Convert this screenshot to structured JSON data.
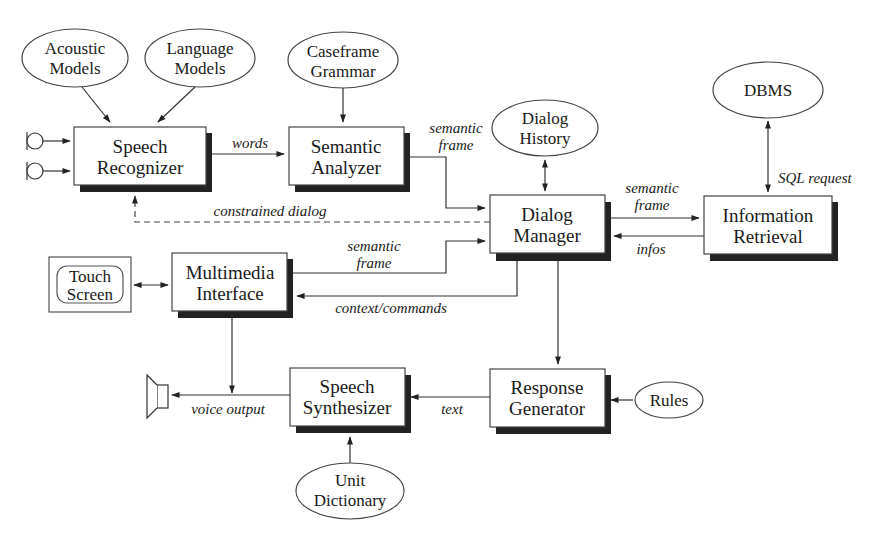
{
  "diagram": {
    "boxes": {
      "speech_recognizer": [
        "Speech",
        "Recognizer"
      ],
      "semantic_analyzer": [
        "Semantic",
        "Analyzer"
      ],
      "dialog_manager": [
        "Dialog",
        "Manager"
      ],
      "information_retrieval": [
        "Information",
        "Retrieval"
      ],
      "multimedia_interface": [
        "Multimedia",
        "Interface"
      ],
      "speech_synthesizer": [
        "Speech",
        "Synthesizer"
      ],
      "response_generator": [
        "Response",
        "Generator"
      ],
      "touch_screen": [
        "Touch",
        "Screen"
      ]
    },
    "ellipses": {
      "acoustic_models": [
        "Acoustic",
        "Models"
      ],
      "language_models": [
        "Language",
        "Models"
      ],
      "caseframe_grammar": [
        "Caseframe",
        "Grammar"
      ],
      "dialog_history": [
        "Dialog",
        "History"
      ],
      "dbms": [
        "DBMS"
      ],
      "rules": [
        "Rules"
      ],
      "unit_dictionary": [
        "Unit",
        "Dictionary"
      ]
    },
    "edge_labels": {
      "words": "words",
      "semantic_frame_1": [
        "semantic",
        "frame"
      ],
      "constrained_dialog": "constrained dialog",
      "semantic_frame_2": [
        "semantic",
        "frame"
      ],
      "infos": "infos",
      "sql_request": "SQL request",
      "semantic_frame_3": [
        "semantic",
        "frame"
      ],
      "context_commands": "context/commands",
      "voice_output": "voice output",
      "text": "text"
    }
  }
}
